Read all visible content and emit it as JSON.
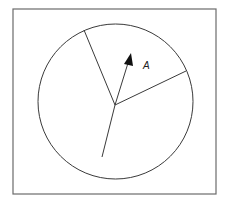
{
  "diagram": {
    "type": "circle-with-radii-and-vector",
    "frame": {
      "x": 13,
      "y": 9,
      "width": 203,
      "height": 185,
      "color": "#6b6b6b"
    },
    "circle": {
      "cx": 115.5,
      "cy": 101.5,
      "r": 77.5,
      "color": "#3a3a3a"
    },
    "center": {
      "x": 115,
      "y": 105
    },
    "radii": [
      {
        "name": "upper-left-radius",
        "x2": 84,
        "y2": 30
      },
      {
        "name": "right-radius",
        "x2": 186,
        "y2": 71
      },
      {
        "name": "lower-line",
        "x2": 102,
        "y2": 157
      }
    ],
    "vector": {
      "from": {
        "x": 115,
        "y": 105
      },
      "tip": {
        "x": 131,
        "y": 53
      },
      "head_base_left": {
        "x": 124,
        "y": 64
      },
      "head_base_right": {
        "x": 133,
        "y": 66
      },
      "label": "A",
      "label_pos": {
        "x": 143,
        "y": 69
      }
    }
  }
}
